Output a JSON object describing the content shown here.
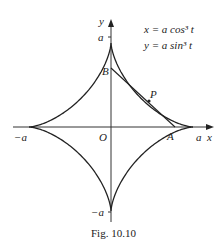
{
  "figure": {
    "caption": "Fig. 10.10",
    "equations": [
      "x = a cos³ t",
      "y = a sin³ t"
    ],
    "axis_labels": {
      "x": "x",
      "y": "y"
    },
    "tick_labels": {
      "x_pos": "a",
      "x_neg": "−a",
      "y_pos": "a",
      "y_neg": "−a"
    },
    "points": {
      "origin": "O",
      "A": "A",
      "B": "B",
      "P": "P"
    },
    "curve": "astroid",
    "colors": {
      "stroke": "#222222",
      "background": "#ffffff"
    }
  }
}
